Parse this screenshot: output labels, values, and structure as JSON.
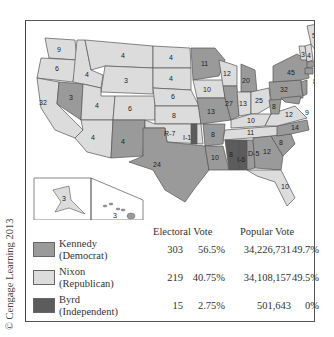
{
  "colors": {
    "kennedy": "#9a9a9a",
    "nixon": "#dcdcdc",
    "byrd": "#5c5c5c",
    "border": "#555555"
  },
  "credit": "© Cengage Learning 2013",
  "legend": {
    "headers": {
      "electoral": "Electoral Vote",
      "popular": "Popular Vote"
    },
    "rows": [
      {
        "name": "Kennedy",
        "party": "(Democrat)",
        "ev": "303",
        "ev_pct": "56.5%",
        "pv": "34,226,731",
        "pv_pct": "49.7%",
        "color": "#9a9a9a"
      },
      {
        "name": "Nixon",
        "party": "(Republican)",
        "ev": "219",
        "ev_pct": "40.75%",
        "pv": "34,108,157",
        "pv_pct": "49.5%",
        "color": "#dcdcdc"
      },
      {
        "name": "Byrd",
        "party": "(Independent)",
        "ev": "15",
        "ev_pct": "2.75%",
        "pv": "501,643",
        "pv_pct": "0%",
        "color": "#5c5c5c"
      }
    ]
  },
  "states": {
    "WA": "9",
    "OR": "6",
    "CA": "32",
    "NV": "3",
    "ID": "4",
    "MT": "4",
    "WY": "3",
    "UT": "4",
    "CO": "6",
    "AZ": "4",
    "NM": "4",
    "ND": "4",
    "SD": "4",
    "NE": "6",
    "KS": "8",
    "OK": "R-7",
    "OK_byrd": "I-1",
    "TX": "24",
    "MN": "11",
    "IA": "10",
    "MO": "13",
    "AR": "8",
    "LA": "10",
    "WI": "12",
    "IL": "27",
    "MI": "20",
    "IN": "13",
    "OH": "25",
    "KY": "10",
    "TN": "11",
    "MS": "8",
    "AL_byrd": "I-6",
    "AL_dem": "D-5",
    "GA": "12",
    "FL": "10",
    "SC": "8",
    "NC": "14",
    "VA": "12",
    "WV": "8",
    "PA": "32",
    "NY": "45",
    "ME": "5",
    "NH": "4",
    "VT": "3",
    "MA": "16",
    "RI": "4",
    "CT": "8",
    "NJ": "16",
    "DE": "3",
    "MD": "9",
    "AK": "3",
    "HI": "3"
  }
}
